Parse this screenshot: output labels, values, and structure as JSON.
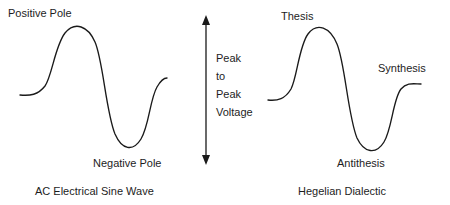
{
  "figure": {
    "title_internal": "AC Electrical Sine Wave compared to Hegelian Dialectic",
    "background_color": "#ffffff",
    "stroke_color": "#1a1a1a",
    "text_color": "#1d1d1d"
  },
  "left_diagram": {
    "caption": "AC Electrical Sine Wave",
    "labels": {
      "crest": "Positive Pole",
      "trough": "Negative Pole"
    }
  },
  "center": {
    "measure_lines": [
      "Peak",
      "to",
      "Peak",
      "Voltage"
    ],
    "measure_text": "Peak to Peak Voltage",
    "arrow_type": "double-headed-vertical"
  },
  "right_diagram": {
    "caption": "Hegelian Dialectic",
    "labels": {
      "crest": "Thesis",
      "trough": "Antithesis",
      "end": "Synthesis"
    }
  }
}
